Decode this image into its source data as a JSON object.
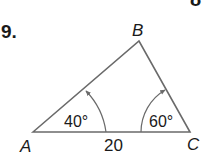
{
  "problem": {
    "number": "9.",
    "partial_top_glyph": "8"
  },
  "triangle": {
    "vertices": {
      "A": {
        "label": "A",
        "x": 33,
        "y": 132
      },
      "B": {
        "label": "B",
        "x": 139,
        "y": 41
      },
      "C": {
        "label": "C",
        "x": 190,
        "y": 132
      }
    },
    "side_AC_label": "20",
    "angle_A_label": "40°",
    "angle_C_label": "60°",
    "line_color": "#6a6a6a",
    "text_color": "#1a1a1a"
  }
}
